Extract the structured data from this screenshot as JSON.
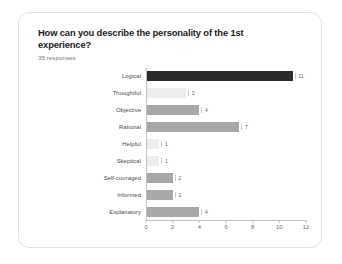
{
  "card": {
    "title": "How can you describe the personality of the 1st experience?",
    "subtitle": "35 responses"
  },
  "chart_data": {
    "type": "bar",
    "orientation": "horizontal",
    "title": "How can you describe the personality of the 1st experience?",
    "subtitle": "35 responses",
    "xlabel": "",
    "ylabel": "",
    "xlim": [
      0,
      12
    ],
    "xticks": [
      0,
      2,
      4,
      6,
      8,
      10,
      12
    ],
    "grid": false,
    "legend": false,
    "categories": [
      "Logical",
      "Thoughtful",
      "Objective",
      "Rational",
      "Helpful",
      "Skeptical",
      "Self-couraged",
      "Informed",
      "Explanatory"
    ],
    "values": [
      11,
      3,
      4,
      7,
      1,
      1,
      2,
      2,
      4
    ],
    "value_labels": [
      "11",
      "3",
      "4",
      "7",
      "1",
      "1",
      "2",
      "2",
      "4"
    ],
    "bar_shades": [
      "dark",
      "light",
      "mid",
      "mid",
      "light",
      "light",
      "mid",
      "mid",
      "mid"
    ],
    "colors": {
      "dark": "#2b2b2b",
      "mid": "#a8a8a8",
      "light": "#ededed",
      "axis": "#c2c2c2",
      "tick_label": "#6d6d6d",
      "category_label": "#4a4a4a",
      "title": "#1c1c1c",
      "subtitle": "#7a7a7a",
      "card_border": "#e4e4e4",
      "background": "#ffffff"
    }
  }
}
